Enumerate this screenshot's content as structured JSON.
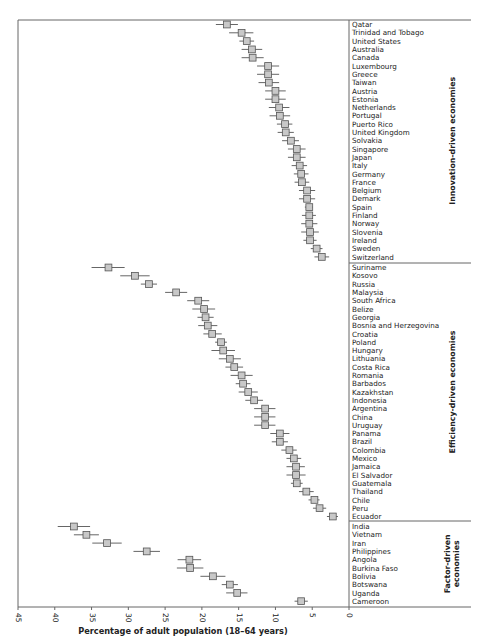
{
  "chart_data": {
    "type": "scatter",
    "orientation": "horizontal-dot-with-error-bars",
    "title": "",
    "xlabel": "Percentage of adult population (18–64 years)",
    "ylabel": "",
    "xlim": [
      45,
      0
    ],
    "x_reversed": true,
    "x_ticks": [
      45,
      40,
      35,
      30,
      25,
      20,
      15,
      10,
      5,
      0
    ],
    "grid": false,
    "legend": null,
    "groups": [
      {
        "name": "Innovation-driven economies",
        "label_lines": [
          "Innovation-driven economies"
        ],
        "points": [
          {
            "country": "Qatar",
            "value": 16.6,
            "low": 15.1,
            "high": 18.1
          },
          {
            "country": "Trinidad and Tobago",
            "value": 14.6,
            "low": 13.0,
            "high": 16.3
          },
          {
            "country": "United States",
            "value": 13.9,
            "low": 12.9,
            "high": 14.9
          },
          {
            "country": "Australia",
            "value": 13.2,
            "low": 11.8,
            "high": 14.6
          },
          {
            "country": "Canada",
            "value": 13.1,
            "low": 11.6,
            "high": 14.6
          },
          {
            "country": "Luxembourg",
            "value": 11.0,
            "low": 9.5,
            "high": 12.5
          },
          {
            "country": "Greece",
            "value": 11.0,
            "low": 9.5,
            "high": 12.5
          },
          {
            "country": "Taiwan",
            "value": 10.9,
            "low": 9.5,
            "high": 12.3
          },
          {
            "country": "Austria",
            "value": 10.0,
            "low": 8.6,
            "high": 11.4
          },
          {
            "country": "Estonia",
            "value": 10.0,
            "low": 8.6,
            "high": 11.4
          },
          {
            "country": "Netherlands",
            "value": 9.5,
            "low": 8.1,
            "high": 10.9
          },
          {
            "country": "Portugal",
            "value": 9.4,
            "low": 8.0,
            "high": 10.8
          },
          {
            "country": "Puerto Rico",
            "value": 8.7,
            "low": 7.7,
            "high": 9.8
          },
          {
            "country": "United Kingdom",
            "value": 8.6,
            "low": 7.5,
            "high": 9.7
          },
          {
            "country": "Solvakia",
            "value": 7.9,
            "low": 6.8,
            "high": 9.1
          },
          {
            "country": "Singapore",
            "value": 7.1,
            "low": 5.9,
            "high": 8.3
          },
          {
            "country": "Japan",
            "value": 7.1,
            "low": 5.9,
            "high": 8.3
          },
          {
            "country": "Italy",
            "value": 6.7,
            "low": 5.7,
            "high": 7.8
          },
          {
            "country": "Germany",
            "value": 6.5,
            "low": 5.5,
            "high": 7.5
          },
          {
            "country": "France",
            "value": 6.4,
            "low": 5.4,
            "high": 7.4
          },
          {
            "country": "Belgium",
            "value": 5.7,
            "low": 4.6,
            "high": 6.8
          },
          {
            "country": "Demark",
            "value": 5.7,
            "low": 4.6,
            "high": 6.8
          },
          {
            "country": "Spain",
            "value": 5.4,
            "low": 4.9,
            "high": 6.0
          },
          {
            "country": "Finland",
            "value": 5.4,
            "low": 4.5,
            "high": 6.4
          },
          {
            "country": "Norway",
            "value": 5.4,
            "low": 4.3,
            "high": 6.5
          },
          {
            "country": "Slovenia",
            "value": 5.3,
            "low": 4.1,
            "high": 6.5
          },
          {
            "country": "Ireland",
            "value": 5.3,
            "low": 4.4,
            "high": 6.2
          },
          {
            "country": "Sweden",
            "value": 4.4,
            "low": 3.6,
            "high": 5.2
          },
          {
            "country": "Switzerland",
            "value": 3.7,
            "low": 2.7,
            "high": 4.7
          }
        ]
      },
      {
        "name": "Efficiency-driven economies",
        "label_lines": [
          "Efficiency-driven economies"
        ],
        "points": [
          {
            "country": "Suriname",
            "value": 32.7,
            "low": 30.5,
            "high": 35.0
          },
          {
            "country": "Kosovo",
            "value": 29.1,
            "low": 27.1,
            "high": 31.1
          },
          {
            "country": "Russia",
            "value": 27.2,
            "low": 26.1,
            "high": 28.3
          },
          {
            "country": "Malaysia",
            "value": 23.5,
            "low": 22.0,
            "high": 25.0
          },
          {
            "country": "South Africa",
            "value": 20.5,
            "low": 19.0,
            "high": 22.0
          },
          {
            "country": "Belize",
            "value": 19.7,
            "low": 18.2,
            "high": 21.3
          },
          {
            "country": "Georgia",
            "value": 19.5,
            "low": 18.4,
            "high": 20.6
          },
          {
            "country": "Bosnia and Herzegovina",
            "value": 19.2,
            "low": 17.9,
            "high": 20.5
          },
          {
            "country": "Croatia",
            "value": 18.6,
            "low": 17.3,
            "high": 19.8
          },
          {
            "country": "Poland",
            "value": 17.4,
            "low": 16.6,
            "high": 18.2
          },
          {
            "country": "Hungary",
            "value": 17.1,
            "low": 15.5,
            "high": 18.7
          },
          {
            "country": "Lithuania",
            "value": 16.2,
            "low": 14.7,
            "high": 17.7
          },
          {
            "country": "Costa Rica",
            "value": 15.6,
            "low": 14.4,
            "high": 16.8
          },
          {
            "country": "Romania",
            "value": 14.6,
            "low": 13.1,
            "high": 16.1
          },
          {
            "country": "Barbados",
            "value": 14.4,
            "low": 13.4,
            "high": 15.4
          },
          {
            "country": "Kazakhstan",
            "value": 13.7,
            "low": 12.4,
            "high": 15.0
          },
          {
            "country": "Indonesia",
            "value": 12.9,
            "low": 11.7,
            "high": 14.1
          },
          {
            "country": "Argentina",
            "value": 11.4,
            "low": 10.0,
            "high": 12.9
          },
          {
            "country": "China",
            "value": 11.4,
            "low": 10.0,
            "high": 12.9
          },
          {
            "country": "Uruguay",
            "value": 11.4,
            "low": 10.0,
            "high": 12.9
          },
          {
            "country": "Panama",
            "value": 9.4,
            "low": 8.1,
            "high": 10.7
          },
          {
            "country": "Brazil",
            "value": 9.4,
            "low": 8.3,
            "high": 10.5
          },
          {
            "country": "Colombia",
            "value": 8.1,
            "low": 7.1,
            "high": 9.2
          },
          {
            "country": "Mexico",
            "value": 7.5,
            "low": 6.5,
            "high": 8.5
          },
          {
            "country": "Jamaica",
            "value": 7.2,
            "low": 6.0,
            "high": 8.5
          },
          {
            "country": "El Salvador",
            "value": 7.2,
            "low": 5.9,
            "high": 8.5
          },
          {
            "country": "Guatemala",
            "value": 7.1,
            "low": 6.3,
            "high": 7.9
          },
          {
            "country": "Thailand",
            "value": 5.8,
            "low": 4.8,
            "high": 6.8
          },
          {
            "country": "Chile",
            "value": 4.7,
            "low": 4.0,
            "high": 5.5
          },
          {
            "country": "Peru",
            "value": 4.0,
            "low": 3.1,
            "high": 4.9
          },
          {
            "country": "Ecuador",
            "value": 2.2,
            "low": 1.5,
            "high": 3.0
          }
        ]
      },
      {
        "name": "Factor-driven economies",
        "label_lines": [
          "Factor-driven",
          "economies"
        ],
        "points": [
          {
            "country": "India",
            "value": 37.4,
            "low": 35.2,
            "high": 39.6
          },
          {
            "country": "Vietnam",
            "value": 35.7,
            "low": 34.0,
            "high": 37.4
          },
          {
            "country": "Iran",
            "value": 32.9,
            "low": 30.9,
            "high": 34.9
          },
          {
            "country": "Philippines",
            "value": 27.5,
            "low": 25.7,
            "high": 29.3
          },
          {
            "country": "Angola",
            "value": 21.7,
            "low": 20.1,
            "high": 23.3
          },
          {
            "country": "Burkina Faso",
            "value": 21.6,
            "low": 19.8,
            "high": 23.4
          },
          {
            "country": "Bolivia",
            "value": 18.5,
            "low": 16.8,
            "high": 20.2
          },
          {
            "country": "Botswana",
            "value": 16.2,
            "low": 15.1,
            "high": 17.3
          },
          {
            "country": "Uganda",
            "value": 15.2,
            "low": 13.8,
            "high": 16.7
          },
          {
            "country": "Cameroon",
            "value": 6.5,
            "low": 5.6,
            "high": 7.4
          }
        ]
      }
    ]
  },
  "style": {
    "marker_fill": "#c8c8c8",
    "marker_stroke": "#555555",
    "axis_color": "#666666",
    "errorbar_color": "#555555",
    "text_color": "#222222"
  },
  "layout": {
    "x0_px": 349,
    "x45_px": 18,
    "plot_top": 20,
    "plot_bottom": 607,
    "right_edge": 471,
    "label_x": 352,
    "group_label_x": 452,
    "rows": {
      "innovation_first_y": 24.5,
      "efficiency_first_y": 267.5,
      "factor_first_y": 526.5,
      "row_step": 8.3,
      "separators_y": [
        263,
        521
      ]
    }
  }
}
